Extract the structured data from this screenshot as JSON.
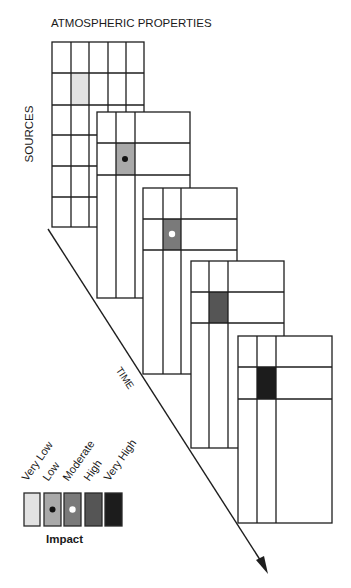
{
  "diagram": {
    "title": "ATMOSPHERIC PROPERTIES",
    "y_axis_label": "SOURCES",
    "time_axis_label": "TIME",
    "colors": {
      "line": "#1e1e1e",
      "very_low": "#e2e2e2",
      "low": "#a9a9a9",
      "moderate": "#7a7a7a",
      "high": "#555555",
      "very_high": "#1c1c1c"
    },
    "main_grid": {
      "columns": 5,
      "rows": 6,
      "highlighted_cell": {
        "row": 2,
        "col": 2,
        "level": "Very Low"
      }
    },
    "time_panels": [
      {
        "step": 1,
        "highlighted_level": "Low",
        "marker": "black-dot"
      },
      {
        "step": 2,
        "highlighted_level": "Moderate",
        "marker": "white-dot"
      },
      {
        "step": 3,
        "highlighted_level": "High",
        "marker": "none"
      },
      {
        "step": 4,
        "highlighted_level": "Very High",
        "marker": "none"
      }
    ]
  },
  "legend": {
    "title": "Impact",
    "items": [
      {
        "label": "Very Low",
        "marker": "none"
      },
      {
        "label": "Low",
        "marker": "black-dot"
      },
      {
        "label": "Moderate",
        "marker": "white-dot"
      },
      {
        "label": "High",
        "marker": "none"
      },
      {
        "label": "Very High",
        "marker": "none"
      }
    ]
  }
}
